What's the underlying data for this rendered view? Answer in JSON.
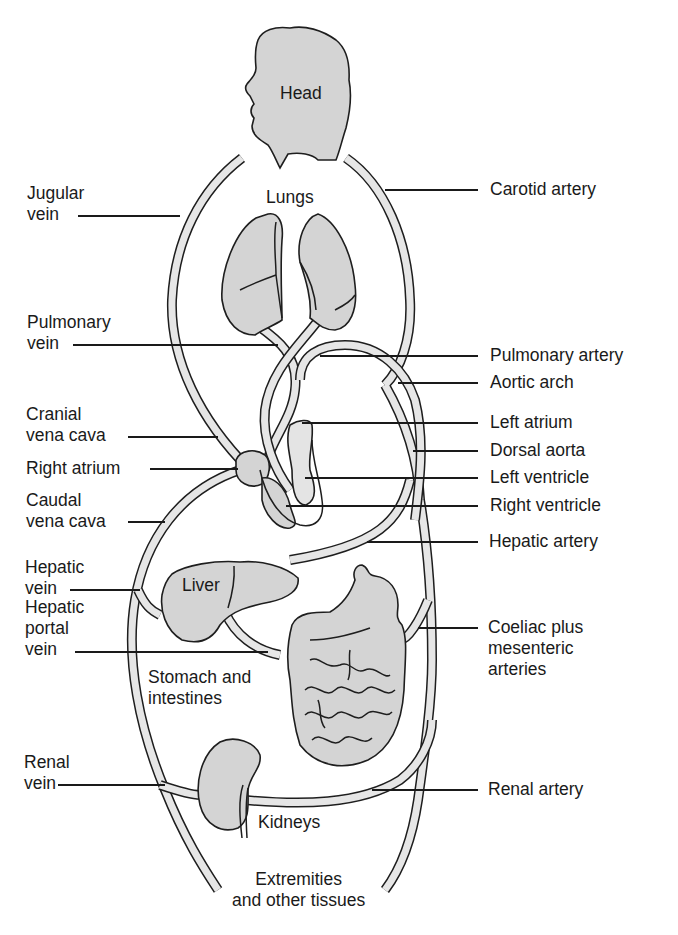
{
  "figure": {
    "type": "anatomical circulation diagram",
    "colors": {
      "organ_fill": "#d4d4d4",
      "vessel_fill": "#e6e6e6",
      "line": "#1e1e1e",
      "background": "#ffffff"
    }
  },
  "organs": {
    "head": "Head",
    "lungs": "Lungs",
    "liver": "Liver",
    "stomach_intestines": "Stomach and\nintestines",
    "kidneys": "Kidneys",
    "extremities": "Extremities\nand other tissues"
  },
  "left_labels": [
    {
      "id": "jugular-vein",
      "text": "Jugular\nvein"
    },
    {
      "id": "pulmonary-vein",
      "text": "Pulmonary\nvein"
    },
    {
      "id": "cranial-vena-cava",
      "text": "Cranial\nvena cava"
    },
    {
      "id": "right-atrium",
      "text": "Right atrium"
    },
    {
      "id": "caudal-vena-cava",
      "text": "Caudal\nvena cava"
    },
    {
      "id": "hepatic-vein",
      "text": "Hepatic\nvein"
    },
    {
      "id": "hepatic-portal-vein",
      "text": "Hepatic\nportal\nvein"
    },
    {
      "id": "renal-vein",
      "text": "Renal\nvein"
    }
  ],
  "right_labels": [
    {
      "id": "carotid-artery",
      "text": "Carotid artery"
    },
    {
      "id": "pulmonary-artery",
      "text": "Pulmonary artery"
    },
    {
      "id": "aortic-arch",
      "text": "Aortic arch"
    },
    {
      "id": "left-atrium",
      "text": "Left atrium"
    },
    {
      "id": "dorsal-aorta",
      "text": "Dorsal aorta"
    },
    {
      "id": "left-ventricle",
      "text": "Left ventricle"
    },
    {
      "id": "right-ventricle",
      "text": "Right ventricle"
    },
    {
      "id": "hepatic-artery",
      "text": "Hepatic artery"
    },
    {
      "id": "coeliac-mesenteric-arteries",
      "text": "Coeliac plus\nmesenteric\narteries"
    },
    {
      "id": "renal-artery",
      "text": "Renal artery"
    }
  ]
}
